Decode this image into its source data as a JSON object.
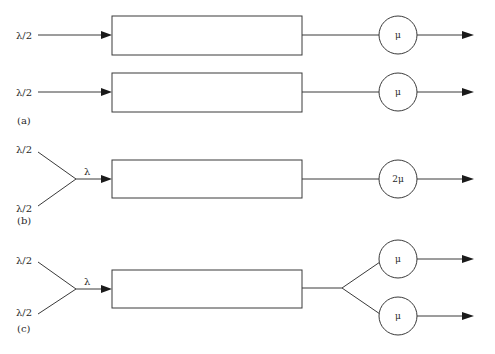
{
  "diagram": {
    "panels": [
      {
        "id": "a",
        "caption": "(a)",
        "queues": [
          {
            "input_label": "λ/2",
            "server_label": "μ"
          },
          {
            "input_label": "λ/2",
            "server_label": "μ"
          }
        ]
      },
      {
        "id": "b",
        "caption": "(b)",
        "inputs": [
          "λ/2",
          "λ/2"
        ],
        "merged_label": "λ",
        "server_label": "2μ"
      },
      {
        "id": "c",
        "caption": "(c)",
        "inputs": [
          "λ/2",
          "λ/2"
        ],
        "merged_label": "λ",
        "server_labels": [
          "μ",
          "μ"
        ]
      }
    ],
    "colors": {
      "stroke": "#3a3a3a",
      "arrowhead": "#1a1a1a",
      "background": "#ffffff"
    }
  }
}
